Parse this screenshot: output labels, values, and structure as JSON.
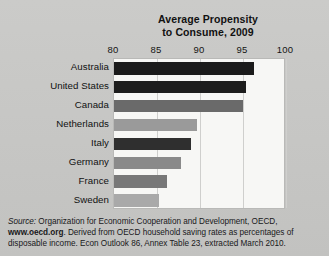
{
  "chart_data": {
    "type": "bar",
    "orientation": "horizontal",
    "title": "Average Propensity to Consume, 2009",
    "title_line1": "Average Propensity",
    "title_line2": "to Consume, 2009",
    "xlabel": "",
    "ylabel": "",
    "xlim": [
      80,
      100
    ],
    "xticks": [
      80,
      85,
      90,
      95,
      100
    ],
    "xtick_labels": [
      "80",
      "85",
      "90",
      "95",
      "100"
    ],
    "grid": true,
    "legend": "none",
    "categories": [
      "Australia",
      "United States",
      "Canada",
      "Netherlands",
      "Italy",
      "Germany",
      "France",
      "Sweden"
    ],
    "values": [
      96.3,
      95.3,
      95.0,
      89.7,
      89.0,
      87.8,
      86.2,
      85.2
    ],
    "bar_colors": [
      "#1b1b1b",
      "#1d1d1d",
      "#6a6a6a",
      "#9a9a9a",
      "#2f2f2f",
      "#8a8a8a",
      "#787878",
      "#a9a9a9"
    ],
    "plot_background": "#f7f7f5"
  },
  "source": {
    "lead": "Source:",
    "line1_rest": " Organization for Economic Cooperation and Development, OECD,",
    "url": "www.oecd.org",
    "line2_rest": ". Derived from OECD household saving rates as percentages",
    "line3": "of disposable income. Econ Outlook 86, Annex Table 23, extracted March 2010."
  }
}
